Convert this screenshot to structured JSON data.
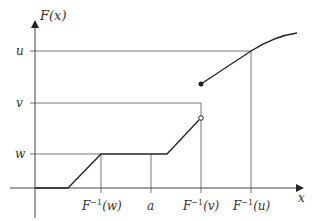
{
  "diagram": {
    "y_axis_label": "F(x)",
    "x_axis_label": "x",
    "y_levels": [
      {
        "name": "u",
        "label": "u"
      },
      {
        "name": "v",
        "label": "v"
      },
      {
        "name": "w",
        "label": "w"
      }
    ],
    "x_ticks": [
      {
        "name": "F-inverse-w",
        "base": "F",
        "sup": "−1",
        "arg": "(w)"
      },
      {
        "name": "a",
        "label": "a"
      },
      {
        "name": "F-inverse-v",
        "base": "F",
        "sup": "−1",
        "arg": "(v)"
      },
      {
        "name": "F-inverse-u",
        "base": "F",
        "sup": "−1",
        "arg": "(u)"
      }
    ],
    "colors": {
      "curve": "#222222",
      "guides": "#777777",
      "axes": "#444444",
      "text": "#333333"
    }
  }
}
